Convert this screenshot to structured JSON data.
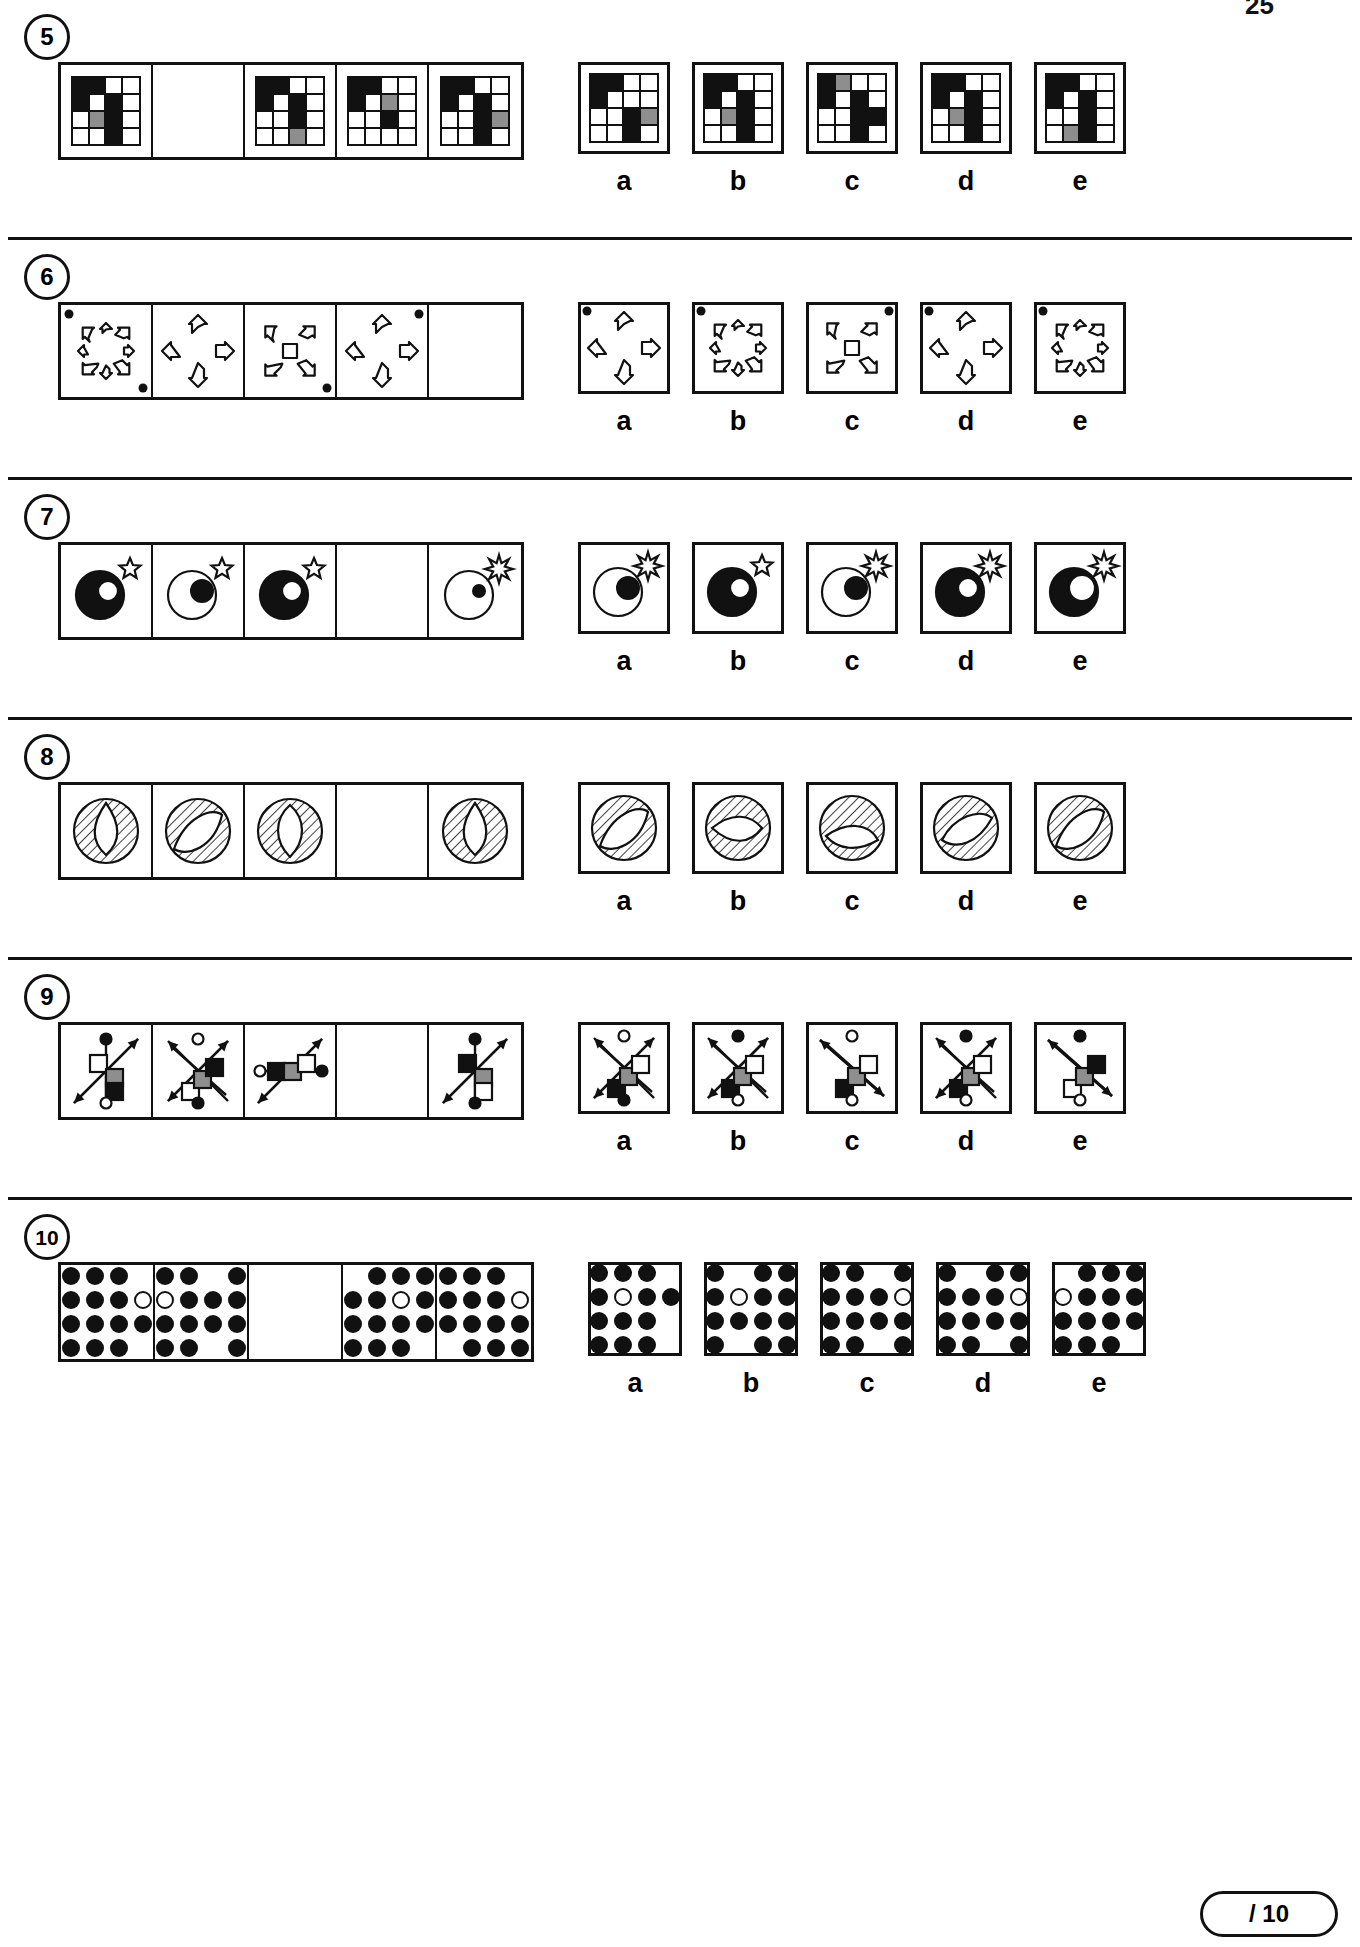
{
  "page": {
    "number": "25",
    "score_label": "/ 10"
  },
  "option_labels": [
    "a",
    "b",
    "c",
    "d",
    "e"
  ],
  "items": [
    {
      "number": "5",
      "type": "grid-matrix",
      "stem": [
        {
          "blank": false,
          "grid": [
            "k",
            "k",
            "w",
            "w",
            "k",
            "w",
            "k",
            "w",
            "w",
            "y",
            "k",
            "w",
            "w",
            "w",
            "k",
            "w"
          ]
        },
        {
          "blank": true,
          "grid": []
        },
        {
          "blank": false,
          "grid": [
            "k",
            "k",
            "w",
            "w",
            "k",
            "w",
            "k",
            "w",
            "w",
            "w",
            "k",
            "w",
            "w",
            "w",
            "y",
            "w"
          ]
        },
        {
          "blank": false,
          "grid": [
            "k",
            "k",
            "w",
            "w",
            "k",
            "w",
            "y",
            "w",
            "w",
            "w",
            "k",
            "w",
            "w",
            "w",
            "w",
            "w"
          ]
        },
        {
          "blank": false,
          "grid": [
            "k",
            "k",
            "w",
            "w",
            "k",
            "w",
            "k",
            "w",
            "w",
            "w",
            "k",
            "y",
            "w",
            "w",
            "k",
            "w"
          ]
        }
      ],
      "options": [
        {
          "grid": [
            "k",
            "k",
            "w",
            "w",
            "k",
            "w",
            "w",
            "w",
            "w",
            "w",
            "k",
            "y",
            "w",
            "w",
            "k",
            "w"
          ]
        },
        {
          "grid": [
            "k",
            "k",
            "w",
            "w",
            "k",
            "w",
            "k",
            "w",
            "w",
            "y",
            "k",
            "w",
            "w",
            "w",
            "k",
            "w"
          ]
        },
        {
          "grid": [
            "k",
            "y",
            "w",
            "w",
            "k",
            "w",
            "k",
            "w",
            "w",
            "w",
            "k",
            "k",
            "w",
            "w",
            "k",
            "w"
          ]
        },
        {
          "grid": [
            "k",
            "k",
            "w",
            "w",
            "k",
            "w",
            "k",
            "w",
            "w",
            "y",
            "k",
            "w",
            "w",
            "w",
            "k",
            "w"
          ]
        },
        {
          "grid": [
            "k",
            "k",
            "w",
            "w",
            "k",
            "w",
            "k",
            "w",
            "w",
            "w",
            "k",
            "w",
            "w",
            "y",
            "k",
            "w"
          ]
        }
      ]
    },
    {
      "number": "6",
      "type": "arrow-cluster",
      "stem": [
        {
          "blank": false,
          "shape": "cross-4",
          "dots": [
            "tl",
            "br"
          ]
        },
        {
          "blank": false,
          "shape": "arrows-4-big",
          "dots": []
        },
        {
          "blank": false,
          "shape": "cross-x-small",
          "dots": [
            "br"
          ]
        },
        {
          "blank": false,
          "shape": "arrows-4-big",
          "dots": [
            "tr"
          ]
        },
        {
          "blank": true,
          "shape": "",
          "dots": []
        }
      ],
      "options": [
        {
          "shape": "arrows-4-big",
          "dots": [
            "tl"
          ]
        },
        {
          "shape": "cross-4",
          "dots": [
            "tl"
          ]
        },
        {
          "shape": "cross-x-small",
          "dots": [
            "tr"
          ]
        },
        {
          "shape": "arrows-4-big",
          "dots": [
            "tl"
          ]
        },
        {
          "shape": "cross-4",
          "dots": [
            "tl"
          ]
        }
      ]
    },
    {
      "number": "7",
      "type": "circles-star",
      "stem": [
        {
          "blank": false,
          "big": "filled",
          "small": "open-out",
          "star": "outline-small"
        },
        {
          "blank": false,
          "big": "open",
          "small": "filled-out",
          "star": "outline-small"
        },
        {
          "blank": false,
          "big": "filled",
          "small": "open-in",
          "star": "outline-mid"
        },
        {
          "blank": true,
          "big": "",
          "small": "",
          "star": ""
        },
        {
          "blank": false,
          "big": "open",
          "small": "filled-dot",
          "star": "burst"
        }
      ],
      "options": [
        {
          "big": "open",
          "small": "filled-in",
          "star": "burst-small"
        },
        {
          "big": "filled",
          "small": "open-in",
          "star": "outline"
        },
        {
          "big": "open",
          "small": "filled-in",
          "star": "burst-small"
        },
        {
          "big": "filled",
          "small": "open-in",
          "star": "burst"
        },
        {
          "big": "filled",
          "small": "open-in-big",
          "star": "burst"
        }
      ]
    },
    {
      "number": "8",
      "type": "hatched-circle",
      "stem": [
        {
          "blank": false,
          "inner": "teardrop-up",
          "hatch": "ring-h"
        },
        {
          "blank": false,
          "inner": "lens-diag",
          "hatch": "full-diag"
        },
        {
          "blank": false,
          "inner": "balloon-vert",
          "hatch": "ring-h"
        },
        {
          "blank": true,
          "inner": "",
          "hatch": ""
        },
        {
          "blank": false,
          "inner": "teardrop-up",
          "hatch": "ring-h"
        }
      ],
      "options": [
        {
          "inner": "lens-diag",
          "hatch": "full-diag"
        },
        {
          "inner": "teardrop-left",
          "hatch": "ring-diag"
        },
        {
          "inner": "leaf-low",
          "hatch": "ring-diag"
        },
        {
          "inner": "leaf-diag",
          "hatch": "ring-diag"
        },
        {
          "inner": "lens-diag",
          "hatch": "full-diag"
        }
      ]
    },
    {
      "number": "9",
      "type": "arrow-squares",
      "stem": [
        {
          "blank": false,
          "arrow": "diag-up-right",
          "bar": "vertical",
          "cap_top": "filled",
          "cap_bottom": "open",
          "squares": [
            "white",
            "grey",
            "black"
          ]
        },
        {
          "blank": false,
          "arrow": "x-cross",
          "bar": "diag-down",
          "cap_top": "open",
          "cap_bottom": "filled",
          "squares": [
            "white",
            "grey",
            "black"
          ]
        },
        {
          "blank": false,
          "arrow": "diag-up-right",
          "bar": "horizontal",
          "cap_top": "open",
          "cap_bottom": "filled",
          "squares": [
            "black",
            "grey",
            "white"
          ]
        },
        {
          "blank": true,
          "arrow": "",
          "bar": "",
          "cap_top": "",
          "cap_bottom": "",
          "squares": []
        },
        {
          "blank": false,
          "arrow": "diag-up-right",
          "bar": "vertical",
          "cap_top": "filled",
          "cap_bottom": "filled",
          "squares": [
            "black",
            "grey",
            "white"
          ]
        }
      ],
      "options": [
        {
          "arrow": "x-cross",
          "bar": "diag-down",
          "cap_top": "open",
          "cap_bottom": "filled",
          "squares": [
            "black",
            "grey",
            "white"
          ]
        },
        {
          "arrow": "x-cross",
          "bar": "diag-down",
          "cap_top": "filled",
          "cap_bottom": "open",
          "squares": [
            "black",
            "grey",
            "white"
          ]
        },
        {
          "arrow": "diag-down-right",
          "bar": "diag-down",
          "cap_top": "open",
          "cap_bottom": "open",
          "squares": [
            "black",
            "grey",
            "white"
          ]
        },
        {
          "arrow": "x-cross",
          "bar": "diag-down",
          "cap_top": "filled",
          "cap_bottom": "open",
          "squares": [
            "black",
            "grey",
            "white"
          ]
        },
        {
          "arrow": "diag-down-right",
          "bar": "diag-down",
          "cap_top": "filled",
          "cap_bottom": "open",
          "squares": [
            "white",
            "grey",
            "black"
          ]
        }
      ]
    },
    {
      "number": "10",
      "type": "dot-matrix",
      "stem": [
        {
          "blank": false,
          "dots": [
            "f",
            "f",
            "f",
            "n",
            "f",
            "f",
            "f",
            "o",
            "f",
            "f",
            "f",
            "f",
            "f",
            "f",
            "f",
            "n"
          ]
        },
        {
          "blank": false,
          "dots": [
            "f",
            "f",
            "n",
            "f",
            "o",
            "f",
            "f",
            "f",
            "f",
            "f",
            "f",
            "f",
            "f",
            "f",
            "n",
            "f"
          ]
        },
        {
          "blank": true,
          "dots": []
        },
        {
          "blank": false,
          "dots": [
            "n",
            "f",
            "f",
            "f",
            "f",
            "f",
            "o",
            "f",
            "f",
            "f",
            "f",
            "f",
            "f",
            "f",
            "f",
            "n"
          ]
        },
        {
          "blank": false,
          "dots": [
            "f",
            "f",
            "f",
            "n",
            "f",
            "f",
            "f",
            "o",
            "f",
            "f",
            "f",
            "f",
            "n",
            "f",
            "f",
            "f"
          ]
        }
      ],
      "options": [
        {
          "dots": [
            "f",
            "f",
            "f",
            "n",
            "f",
            "o",
            "f",
            "f",
            "f",
            "f",
            "f",
            "n",
            "f",
            "f",
            "f",
            "n"
          ]
        },
        {
          "dots": [
            "f",
            "n",
            "f",
            "f",
            "f",
            "o",
            "f",
            "f",
            "f",
            "f",
            "f",
            "f",
            "f",
            "n",
            "f",
            "f"
          ]
        },
        {
          "dots": [
            "f",
            "f",
            "n",
            "f",
            "f",
            "f",
            "f",
            "o",
            "f",
            "f",
            "f",
            "f",
            "f",
            "f",
            "n",
            "f"
          ]
        },
        {
          "dots": [
            "f",
            "n",
            "f",
            "f",
            "f",
            "f",
            "f",
            "o",
            "f",
            "f",
            "f",
            "f",
            "f",
            "f",
            "n",
            "f"
          ]
        },
        {
          "dots": [
            "n",
            "f",
            "f",
            "f",
            "o",
            "f",
            "f",
            "f",
            "f",
            "f",
            "f",
            "f",
            "f",
            "f",
            "f",
            "n"
          ]
        }
      ]
    }
  ]
}
